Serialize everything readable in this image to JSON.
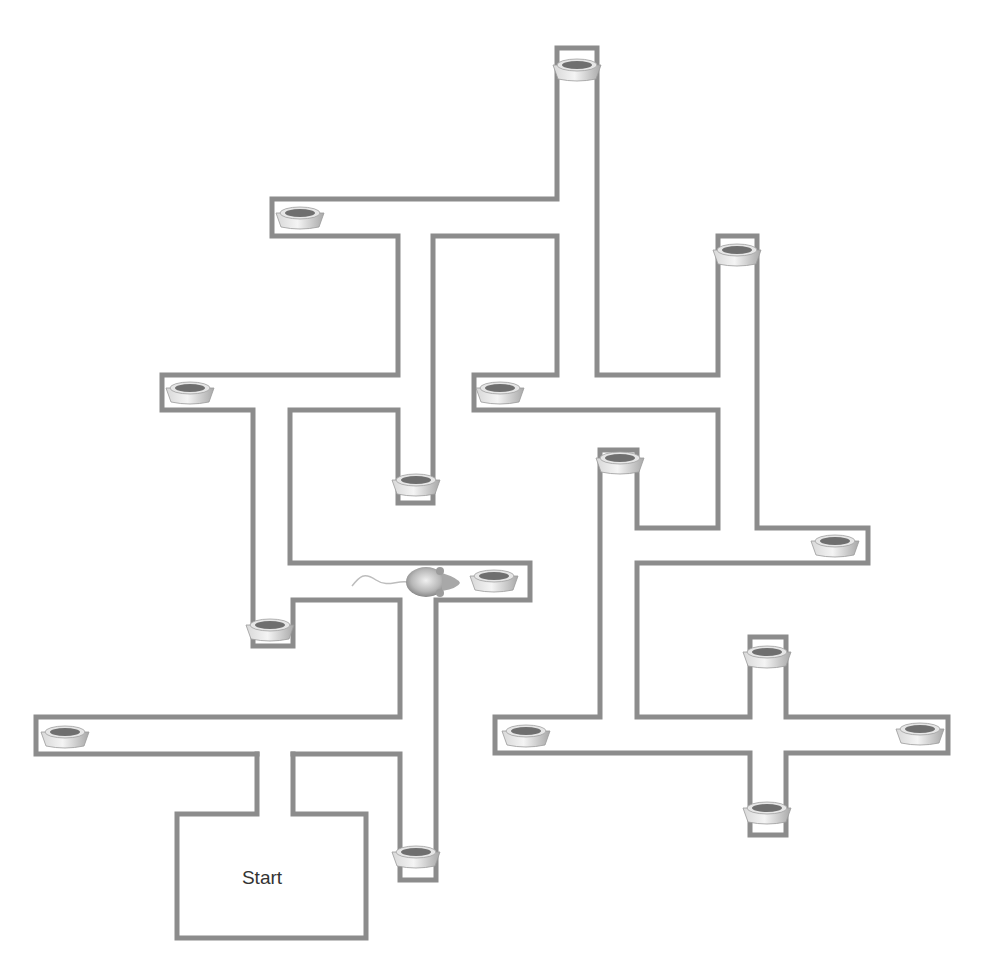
{
  "diagram": {
    "type": "radial-arm-maze",
    "wall_color": "#8c8c8c",
    "background": "#ffffff",
    "start_box": {
      "label": "Start",
      "x": 177,
      "y": 814,
      "w": 190,
      "h": 125
    },
    "walls": [
      {
        "id": "start-box",
        "points": [
          [
            257,
            754
          ],
          [
            257,
            814
          ],
          [
            177,
            814
          ],
          [
            177,
            938
          ],
          [
            366,
            938
          ],
          [
            366,
            814
          ],
          [
            293,
            814
          ],
          [
            293,
            754
          ]
        ]
      },
      {
        "id": "left-arm-corridor",
        "points": [
          [
            257,
            754
          ],
          [
            36,
            754
          ],
          [
            36,
            717
          ],
          [
            400,
            717
          ],
          [
            400,
            600
          ],
          [
            293,
            600
          ],
          [
            293,
            646
          ],
          [
            253,
            646
          ],
          [
            253,
            410
          ],
          [
            162,
            410
          ],
          [
            162,
            375
          ],
          [
            398,
            375
          ],
          [
            398,
            236
          ],
          [
            272,
            236
          ],
          [
            272,
            199
          ],
          [
            557,
            199
          ],
          [
            557,
            48
          ],
          [
            597,
            48
          ],
          [
            597,
            375
          ],
          [
            718,
            375
          ],
          [
            718,
            236
          ],
          [
            757,
            236
          ],
          [
            757,
            528
          ],
          [
            868,
            528
          ],
          [
            868,
            563
          ],
          [
            637,
            563
          ],
          [
            637,
            717
          ],
          [
            750,
            717
          ],
          [
            750,
            637
          ],
          [
            786,
            637
          ],
          [
            786,
            717
          ],
          [
            948,
            717
          ],
          [
            948,
            753
          ],
          [
            786,
            753
          ],
          [
            786,
            835
          ],
          [
            750,
            835
          ],
          [
            750,
            753
          ],
          [
            495,
            753
          ],
          [
            495,
            717
          ],
          [
            600,
            717
          ],
          [
            600,
            450
          ],
          [
            637,
            450
          ],
          [
            637,
            528
          ],
          [
            718,
            528
          ],
          [
            718,
            410
          ],
          [
            474,
            410
          ],
          [
            474,
            375
          ],
          [
            557,
            375
          ],
          [
            557,
            236
          ],
          [
            433,
            236
          ],
          [
            433,
            503
          ],
          [
            398,
            503
          ],
          [
            398,
            410
          ],
          [
            290,
            410
          ],
          [
            290,
            563
          ],
          [
            530,
            563
          ],
          [
            530,
            600
          ],
          [
            436,
            600
          ],
          [
            436,
            880
          ],
          [
            400,
            880
          ],
          [
            400,
            754
          ],
          [
            293,
            754
          ]
        ]
      }
    ],
    "food_bowls": [
      {
        "id": "bowl-top",
        "x": 577,
        "y": 70
      },
      {
        "id": "bowl-upper-left",
        "x": 300,
        "y": 218
      },
      {
        "id": "bowl-right-top",
        "x": 737,
        "y": 255
      },
      {
        "id": "bowl-left-mid",
        "x": 190,
        "y": 393
      },
      {
        "id": "bowl-center-left",
        "x": 500,
        "y": 393
      },
      {
        "id": "bowl-center-drop",
        "x": 416,
        "y": 485
      },
      {
        "id": "bowl-right-mid",
        "x": 620,
        "y": 463
      },
      {
        "id": "bowl-right-arm",
        "x": 835,
        "y": 546
      },
      {
        "id": "bowl-center-arm",
        "x": 494,
        "y": 581
      },
      {
        "id": "bowl-lower-left-drop",
        "x": 270,
        "y": 630
      },
      {
        "id": "bowl-cross-top",
        "x": 767,
        "y": 657
      },
      {
        "id": "bowl-far-left",
        "x": 65,
        "y": 737
      },
      {
        "id": "bowl-cross-left",
        "x": 526,
        "y": 736
      },
      {
        "id": "bowl-cross-right",
        "x": 920,
        "y": 734
      },
      {
        "id": "bowl-start-drop",
        "x": 416,
        "y": 857
      },
      {
        "id": "bowl-cross-bottom",
        "x": 767,
        "y": 813
      }
    ],
    "rat": {
      "x": 426,
      "y": 582,
      "facing": "right"
    }
  }
}
